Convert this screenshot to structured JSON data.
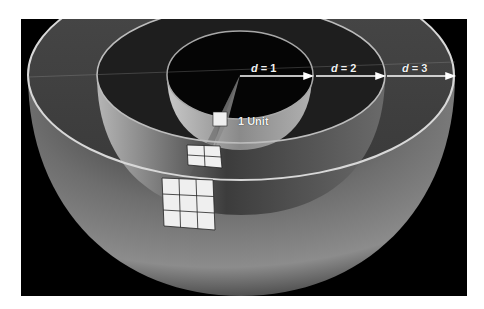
{
  "figure": {
    "colors": {
      "background": "#000000",
      "page": "#ffffff",
      "shell": "#7a7a7a",
      "rim": "#d8d8d8",
      "tile": "#efefef",
      "label": "#f2f2f2"
    },
    "distance_labels": [
      {
        "var": "d",
        "eq": " = 1"
      },
      {
        "var": "d",
        "eq": " = 2"
      },
      {
        "var": "d",
        "eq": " = 3"
      }
    ],
    "unit_label": "1 Unit",
    "tile_grids": [
      {
        "shell": 1,
        "rows": 1,
        "cols": 1
      },
      {
        "shell": 2,
        "rows": 2,
        "cols": 2
      },
      {
        "shell": 3,
        "rows": 3,
        "cols": 3
      }
    ]
  }
}
